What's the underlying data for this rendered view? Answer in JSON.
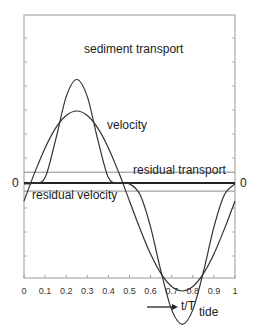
{
  "chart_data": {
    "type": "line",
    "title": "",
    "xlabel": "t/T tide",
    "xlabel_main": "t/T",
    "xlabel_sub": "tide",
    "ylabel": "",
    "xlim": [
      0,
      1
    ],
    "ylim": [
      -1.25,
      1.25
    ],
    "x_ticks": [
      "0",
      "0.1",
      "0.2",
      "0.3",
      "0.4",
      "0.5",
      "0.6",
      "0.7",
      "0.8",
      "0.9",
      "1"
    ],
    "y_zero_label_left": "0",
    "y_zero_label_right": "0",
    "grid": false,
    "x": [
      0,
      0.05,
      0.1,
      0.15,
      0.2,
      0.25,
      0.3,
      0.35,
      0.4,
      0.45,
      0.5,
      0.55,
      0.6,
      0.65,
      0.7,
      0.75,
      0.8,
      0.85,
      0.9,
      0.95,
      1.0
    ],
    "series": [
      {
        "name": "velocity",
        "values": [
          -0.2,
          0.11,
          0.39,
          0.61,
          0.75,
          0.8,
          0.75,
          0.61,
          0.39,
          0.11,
          -0.2,
          -0.51,
          -0.79,
          -1.01,
          -1.15,
          -1.2,
          -1.15,
          -1.01,
          -0.79,
          -0.51,
          -0.2
        ]
      },
      {
        "name": "sediment transport",
        "values": [
          -0.01,
          0.0,
          0.06,
          0.48,
          0.96,
          1.15,
          0.96,
          0.48,
          0.06,
          0.0,
          -0.01,
          -0.13,
          -0.49,
          -0.99,
          -1.41,
          -1.57,
          -1.41,
          -0.99,
          -0.49,
          -0.13,
          -0.01
        ]
      },
      {
        "name": "residual transport",
        "values_constant": 0.05
      },
      {
        "name": "residual velocity",
        "values_constant": -0.04
      }
    ],
    "annotations": [
      {
        "text": "sediment transport",
        "x": 0.28,
        "y": 1.05
      },
      {
        "text": "velocity",
        "x": 0.42,
        "y": 0.45
      },
      {
        "text": "residual transport",
        "x": 0.58,
        "y": 0.1
      },
      {
        "text": "residual velocity",
        "x": 0.03,
        "y": -0.12
      },
      {
        "text": "0",
        "side": "left"
      },
      {
        "text": "0",
        "side": "right"
      }
    ],
    "legend": "none (inline labels)"
  },
  "labels": {
    "sediment_transport": "sediment transport",
    "velocity": "velocity",
    "residual_transport": "residual transport",
    "residual_velocity": "residual velocity",
    "zero_left": "0",
    "zero_right": "0",
    "x_axis_main": "t/T",
    "x_axis_sub": "tide"
  }
}
